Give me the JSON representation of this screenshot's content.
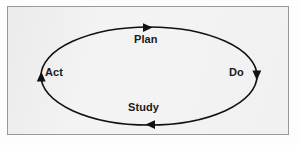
{
  "figure": {
    "name": "PDSA cycle diagram",
    "shape": "ellipse",
    "direction": "clockwise",
    "background_color": "#f2f2f2",
    "border_color": "#9a9a9a",
    "stroke_color": "#111111",
    "text_color": "#1a1a1a"
  },
  "stages": {
    "plan": {
      "label": "Plan",
      "position": "top",
      "arrow": "right-arrowhead"
    },
    "do": {
      "label": "Do",
      "position": "right",
      "arrow": "down-arrowhead"
    },
    "study": {
      "label": "Study",
      "position": "bottom",
      "arrow": "left-arrowhead"
    },
    "act": {
      "label": "Act",
      "position": "left",
      "arrow": "up-arrowhead"
    }
  }
}
